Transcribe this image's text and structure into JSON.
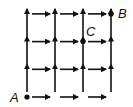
{
  "diagram": {
    "type": "directed-grid",
    "rows": 4,
    "cols": 4,
    "edge_directions": [
      "right",
      "up"
    ],
    "color": "#111111",
    "points": [
      {
        "label": "A",
        "col": 0,
        "row": 0
      },
      {
        "label": "B",
        "col": 3,
        "row": 3
      },
      {
        "label": "C",
        "col": 2,
        "row": 2
      }
    ]
  }
}
